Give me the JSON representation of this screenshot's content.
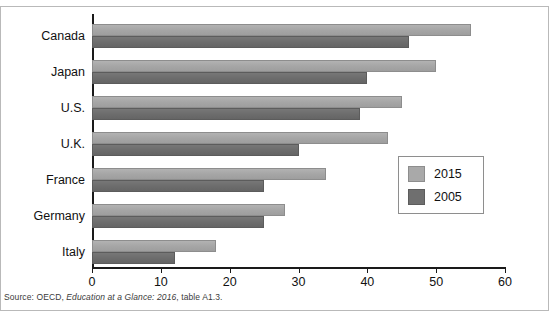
{
  "chart_data": {
    "type": "bar",
    "orientation": "horizontal",
    "title": "",
    "subtitle": "",
    "xlabel": "",
    "ylabel": "",
    "xlim": [
      0,
      60
    ],
    "xticks": [
      0,
      10,
      20,
      30,
      40,
      50,
      60
    ],
    "xtick_labels": [
      "0",
      "10",
      "20",
      "30",
      "40",
      "50",
      "60"
    ],
    "grid": false,
    "legend_position": "center-right",
    "categories": [
      "Canada",
      "Japan",
      "U.S.",
      "U.K.",
      "France",
      "Germany",
      "Italy"
    ],
    "series": [
      {
        "name": "2015",
        "color": "#a9a9a9",
        "values": [
          55,
          50,
          45,
          43,
          34,
          28,
          18
        ]
      },
      {
        "name": "2005",
        "color": "#6f6f6f",
        "values": [
          46,
          40,
          39,
          30,
          25,
          25,
          12
        ]
      }
    ]
  },
  "legend": {
    "entries": [
      {
        "label": "2015",
        "swatch": "light-gray"
      },
      {
        "label": "2005",
        "swatch": "dark-gray"
      }
    ]
  },
  "source": {
    "prefix": "Source: OECD, ",
    "italic": "Education at a Glance: 2016",
    "suffix": ", table A1.3."
  }
}
